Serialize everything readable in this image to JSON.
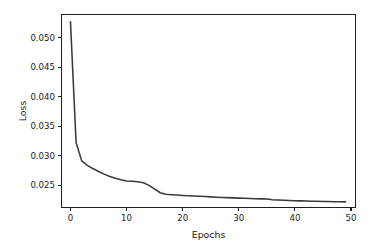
{
  "chart_data": {
    "type": "line",
    "title": "",
    "xlabel": "Epochs",
    "ylabel": "Loss",
    "grid": false,
    "legend": null,
    "legend_position": "none",
    "line_color": "#3a3a3a",
    "xlim": [
      -1.6,
      50.8
    ],
    "ylim": [
      0.02125,
      0.05395
    ],
    "xticks": [
      0,
      10,
      20,
      30,
      40,
      50
    ],
    "xtick_labels": [
      "0",
      "10",
      "20",
      "30",
      "40",
      "50"
    ],
    "yticks": [
      0.025,
      0.03,
      0.035,
      0.04,
      0.045,
      0.05
    ],
    "ytick_labels": [
      "0.025",
      "0.030",
      "0.035",
      "0.040",
      "0.045",
      "0.050"
    ],
    "series": [
      {
        "name": "training loss",
        "x": [
          0,
          1,
          2,
          3,
          4,
          5,
          6,
          7,
          8,
          9,
          10,
          11,
          12,
          13,
          14,
          15,
          16,
          17,
          18,
          19,
          20,
          21,
          22,
          23,
          24,
          25,
          26,
          27,
          28,
          29,
          30,
          31,
          32,
          33,
          34,
          35,
          36,
          37,
          38,
          39,
          40,
          41,
          42,
          43,
          44,
          45,
          46,
          47,
          48,
          49
        ],
        "values": [
          0.0527,
          0.03225,
          0.02915,
          0.0284,
          0.02785,
          0.02735,
          0.0269,
          0.0265,
          0.0262,
          0.02595,
          0.02575,
          0.02568,
          0.02562,
          0.02545,
          0.025,
          0.02435,
          0.02375,
          0.0235,
          0.02342,
          0.02336,
          0.0233,
          0.02325,
          0.0232,
          0.02315,
          0.0231,
          0.02305,
          0.023,
          0.02296,
          0.02292,
          0.02288,
          0.02284,
          0.0228,
          0.02277,
          0.02274,
          0.02271,
          0.02268,
          0.02258,
          0.02252,
          0.02248,
          0.02244,
          0.0224,
          0.02237,
          0.02234,
          0.02232,
          0.0223,
          0.02228,
          0.02226,
          0.02224,
          0.02222,
          0.0222
        ]
      }
    ]
  }
}
